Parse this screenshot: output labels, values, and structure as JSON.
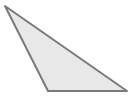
{
  "diagram": {
    "shape": "triangle",
    "type": "obtuse-scalene",
    "vertices": [
      {
        "x": 5,
        "y": 6
      },
      {
        "x": 48,
        "y": 91
      },
      {
        "x": 127,
        "y": 91
      }
    ],
    "points": "5,6 48,91 127,91",
    "fill": "#e8e8e8",
    "stroke": "#7a7a7a",
    "stroke_width": "2"
  }
}
